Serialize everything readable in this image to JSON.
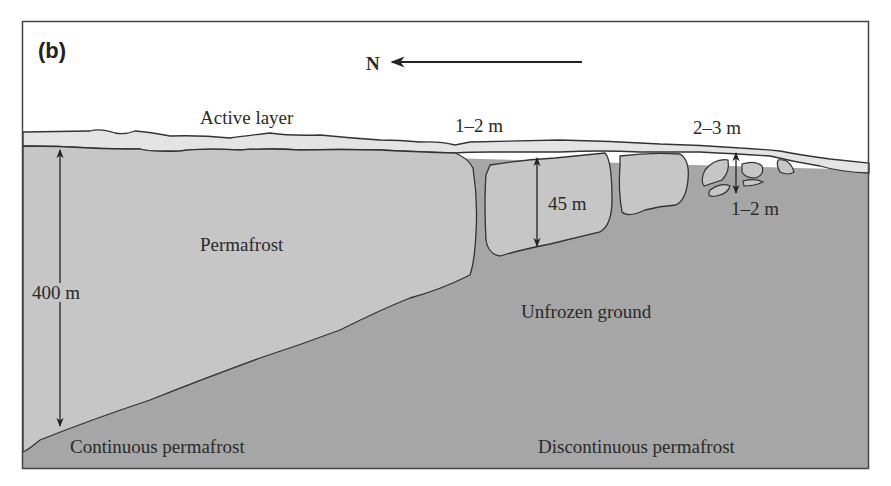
{
  "figure": {
    "panel_label": "(b)",
    "direction": {
      "label": "N",
      "icon": "arrow-left-icon"
    },
    "colors": {
      "sky": "#ffffff",
      "active_layer": "#e4e4e4",
      "permafrost": "#c6c6c6",
      "unfrozen_ground": "#a6a6a6",
      "outline": "#333333"
    },
    "labels": {
      "active_layer": "Active layer",
      "active_depth_1": "1–2 m",
      "active_depth_2": "2–3 m",
      "permafrost": "Permafrost",
      "depth_400": "400 m",
      "depth_45": "45 m",
      "depth_small": "1–2 m",
      "unfrozen": "Unfrozen ground",
      "continuous": "Continuous permafrost",
      "discontinuous": "Discontinuous permafrost"
    }
  }
}
